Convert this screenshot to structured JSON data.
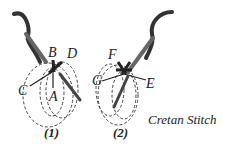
{
  "diagram": {
    "title": "Cretan Stitch",
    "figure1": {
      "caption": "(1)",
      "labels": {
        "a": "A",
        "b": "B",
        "c": "C",
        "d": "D"
      }
    },
    "figure2": {
      "caption": "(2)",
      "labels": {
        "e": "E",
        "f": "F",
        "g": "G"
      }
    },
    "colors": {
      "ink": "#222222",
      "thread": "#333333",
      "needle": "#555555",
      "background": "#ffffff"
    }
  }
}
